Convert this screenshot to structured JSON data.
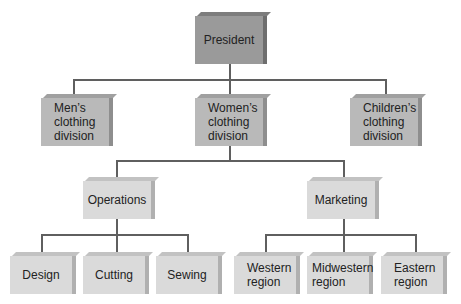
{
  "chart": {
    "type": "organizational-chart",
    "root": {
      "label": "President",
      "children": [
        {
          "label": "Men’s\nclothing\ndivision"
        },
        {
          "label": "Women’s\nclothing\ndivision",
          "children": [
            {
              "label": "Operations",
              "children": [
                {
                  "label": "Design"
                },
                {
                  "label": "Cutting"
                },
                {
                  "label": "Sewing"
                }
              ]
            },
            {
              "label": "Marketing",
              "children": [
                {
                  "label": "Western\nregion"
                },
                {
                  "label": "Midwestern\nregion"
                },
                {
                  "label": "Eastern\nregion"
                }
              ]
            }
          ]
        },
        {
          "label": "Children’s\nclothing\ndivision"
        }
      ]
    }
  },
  "nodes": {
    "president": "President",
    "mens": "Men’s\nclothing\ndivision",
    "womens": "Women’s\nclothing\ndivision",
    "childrens": "Children’s\nclothing\ndivision",
    "operations": "Operations",
    "marketing": "Marketing",
    "design": "Design",
    "cutting": "Cutting",
    "sewing": "Sewing",
    "western": "Western\nregion",
    "midwestern": "Midwestern\nregion",
    "eastern": "Eastern\nregion"
  },
  "colors": {
    "level0": "#9a9a9a",
    "level1": "#b9b9b9",
    "level2": "#dadada",
    "connector": "#5f5f5f"
  }
}
